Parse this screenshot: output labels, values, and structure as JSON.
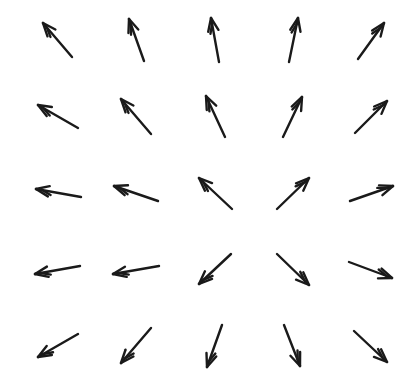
{
  "diagram": {
    "type": "vector-field",
    "grid": {
      "rows": 5,
      "cols": 5
    },
    "stroke_color": "#1a1a1a",
    "background_color": "#ffffff",
    "arrows": [
      {
        "row": 1,
        "col": 1,
        "tail": [
          72,
          57
        ],
        "head": [
          43,
          23
        ]
      },
      {
        "row": 1,
        "col": 2,
        "tail": [
          144,
          61
        ],
        "head": [
          129,
          19
        ]
      },
      {
        "row": 1,
        "col": 3,
        "tail": [
          219,
          62
        ],
        "head": [
          211,
          18
        ]
      },
      {
        "row": 1,
        "col": 4,
        "tail": [
          289,
          62
        ],
        "head": [
          298,
          18
        ]
      },
      {
        "row": 1,
        "col": 5,
        "tail": [
          358,
          59
        ],
        "head": [
          384,
          23
        ]
      },
      {
        "row": 2,
        "col": 1,
        "tail": [
          78,
          128
        ],
        "head": [
          38,
          105
        ]
      },
      {
        "row": 2,
        "col": 2,
        "tail": [
          151,
          134
        ],
        "head": [
          121,
          99
        ]
      },
      {
        "row": 2,
        "col": 3,
        "tail": [
          225,
          137
        ],
        "head": [
          206,
          96
        ]
      },
      {
        "row": 2,
        "col": 4,
        "tail": [
          283,
          137
        ],
        "head": [
          302,
          97
        ]
      },
      {
        "row": 2,
        "col": 5,
        "tail": [
          355,
          133
        ],
        "head": [
          387,
          101
        ]
      },
      {
        "row": 3,
        "col": 1,
        "tail": [
          81,
          197
        ],
        "head": [
          36,
          189
        ]
      },
      {
        "row": 3,
        "col": 2,
        "tail": [
          158,
          201
        ],
        "head": [
          114,
          186
        ]
      },
      {
        "row": 3,
        "col": 3,
        "tail": [
          232,
          209
        ],
        "head": [
          199,
          178
        ]
      },
      {
        "row": 3,
        "col": 4,
        "tail": [
          277,
          209
        ],
        "head": [
          309,
          178
        ]
      },
      {
        "row": 3,
        "col": 5,
        "tail": [
          350,
          201
        ],
        "head": [
          393,
          186
        ]
      },
      {
        "row": 4,
        "col": 1,
        "tail": [
          80,
          266
        ],
        "head": [
          35,
          274
        ]
      },
      {
        "row": 4,
        "col": 2,
        "tail": [
          159,
          266
        ],
        "head": [
          113,
          274
        ]
      },
      {
        "row": 4,
        "col": 3,
        "tail": [
          231,
          254
        ],
        "head": [
          199,
          284
        ]
      },
      {
        "row": 4,
        "col": 4,
        "tail": [
          277,
          254
        ],
        "head": [
          309,
          285
        ]
      },
      {
        "row": 4,
        "col": 5,
        "tail": [
          349,
          262
        ],
        "head": [
          392,
          278
        ]
      },
      {
        "row": 5,
        "col": 1,
        "tail": [
          78,
          334
        ],
        "head": [
          38,
          357
        ]
      },
      {
        "row": 5,
        "col": 2,
        "tail": [
          151,
          328
        ],
        "head": [
          121,
          363
        ]
      },
      {
        "row": 5,
        "col": 3,
        "tail": [
          222,
          325
        ],
        "head": [
          207,
          367
        ]
      },
      {
        "row": 5,
        "col": 4,
        "tail": [
          284,
          325
        ],
        "head": [
          300,
          366
        ]
      },
      {
        "row": 5,
        "col": 5,
        "tail": [
          354,
          331
        ],
        "head": [
          387,
          362
        ]
      }
    ]
  }
}
